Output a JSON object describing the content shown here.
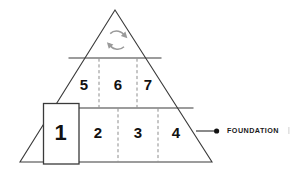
{
  "diagram": {
    "type": "pyramid",
    "background_color": "#ffffff",
    "outline_color": "#3a3a3a",
    "dashed_divider_color": "#8d8d8d",
    "apex_icon": {
      "name": "cycle-arrows-icon",
      "color": "#9a9a9a"
    },
    "tiers": [
      {
        "name": "apex-tier",
        "cells": []
      },
      {
        "name": "middle-tier",
        "cells": [
          {
            "label": "5"
          },
          {
            "label": "6"
          },
          {
            "label": "7"
          }
        ]
      },
      {
        "name": "base-tier",
        "cells": [
          {
            "label": "1"
          },
          {
            "label": "2"
          },
          {
            "label": "3"
          },
          {
            "label": "4"
          }
        ]
      }
    ],
    "callout": {
      "label": "FOUNDATION",
      "dot_color": "#111111",
      "line_color": "#2b2b2b"
    }
  }
}
